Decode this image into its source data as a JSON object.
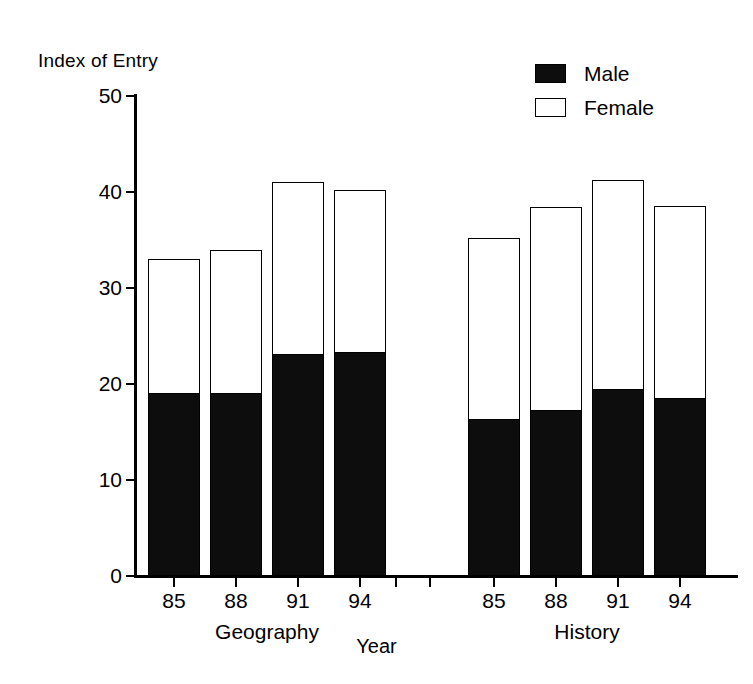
{
  "chart_data": {
    "type": "bar",
    "subtype": "stacked",
    "title": "",
    "ylabel": "Index of Entry",
    "xlabel": "Year",
    "ylim": [
      0,
      50
    ],
    "yticks": [
      0,
      10,
      20,
      30,
      40,
      50
    ],
    "ytick_labels": [
      "0",
      "10",
      "20",
      "30",
      "40",
      "50"
    ],
    "grid": false,
    "legend_position": "top-right",
    "legend": [
      "Male",
      "Female"
    ],
    "colors": {
      "male": "#0d0d0d",
      "female": "#ffffff",
      "outline": "#000000"
    },
    "groups": [
      {
        "label": "Geography",
        "categories": [
          "85",
          "88",
          "91",
          "94"
        ]
      },
      {
        "label": "History",
        "categories": [
          "85",
          "88",
          "91",
          "94"
        ]
      }
    ],
    "categories": [
      "85",
      "88",
      "91",
      "94",
      "85",
      "88",
      "91",
      "94"
    ],
    "series": [
      {
        "name": "Male",
        "values": [
          19.0,
          19.0,
          23.0,
          23.2,
          16.2,
          17.2,
          19.4,
          18.4
        ]
      },
      {
        "name": "Female",
        "values": [
          14.0,
          15.0,
          18.0,
          17.0,
          19.0,
          21.2,
          21.9,
          20.1
        ]
      }
    ],
    "totals": [
      33.0,
      34.0,
      41.0,
      40.2,
      35.2,
      38.4,
      41.3,
      38.5
    ]
  },
  "legend": {
    "items": [
      {
        "label": "Male",
        "swatch": "filled-square-icon"
      },
      {
        "label": "Female",
        "swatch": "hollow-square-icon"
      }
    ]
  },
  "axes": {
    "y_title": "Index of Entry",
    "x_title": "Year",
    "y_ticks": [
      "0",
      "10",
      "20",
      "30",
      "40",
      "50"
    ],
    "x_ticks": [
      "85",
      "88",
      "91",
      "94",
      "85",
      "88",
      "91",
      "94"
    ],
    "group_labels": [
      "Geography",
      "History"
    ]
  }
}
